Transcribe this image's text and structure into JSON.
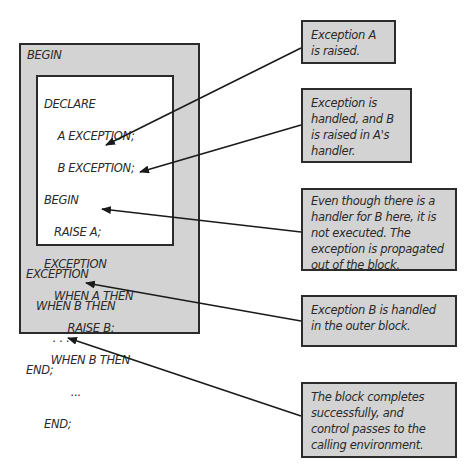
{
  "outer_block": {
    "begin": "BEGIN",
    "exception": "EXCEPTION",
    "when_b": "   WHEN B THEN",
    "dots": "        . . .",
    "end": "END;"
  },
  "inner_block": {
    "lines": [
      "DECLARE",
      "    A EXCEPTION;",
      "    B EXCEPTION;",
      "BEGIN",
      "   RAISE A;",
      "EXCEPTION",
      "   WHEN A THEN",
      "       RAISE B;",
      "  WHEN B THEN",
      "        ...",
      "END;"
    ]
  },
  "callouts": [
    {
      "text_lines": [
        "Exception  A",
        "is raised."
      ]
    },
    {
      "text_lines": [
        "Exception is",
        "handled, and B",
        "is raised in A's",
        "handler."
      ]
    },
    {
      "text_lines": [
        "Even though there is a",
        "handler for B here, it is",
        "not executed. The",
        "exception is propagated",
        "out of the block."
      ]
    },
    {
      "text_lines": [
        "Exception B is handled",
        "in the outer block."
      ]
    },
    {
      "text_lines": [
        "The block completes",
        "successfully, and",
        "control passes to the",
        "calling environment."
      ]
    }
  ],
  "colors": {
    "box_fill": "#d3d3d3",
    "border": "#2b2b2b",
    "inner_fill": "#ffffff"
  }
}
